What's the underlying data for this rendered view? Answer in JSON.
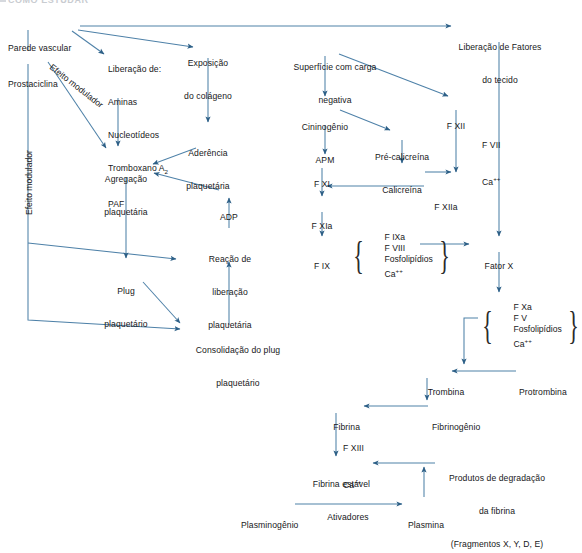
{
  "page": {
    "header_partial": "COMO ESTUDAR",
    "line_color": "#4e81a8",
    "text_color": "#17181a",
    "background": "#ffffff",
    "width": 558,
    "height": 530
  },
  "nodes": {
    "parede_vascular": "Parede vascular",
    "prostaciclina": "Prostaciclina",
    "liberacao_de_title": "Liberação de:",
    "liberacao_de_1": "Aminas",
    "liberacao_de_2": "Nucleotídeos",
    "liberacao_de_3": "Tromboxano A",
    "liberacao_de_3_sub": "2",
    "liberacao_de_4": "PAF",
    "exposicao_colageno_1": "Exposição",
    "exposicao_colageno_2": "do colágeno",
    "aderencia_plaquetaria_1": "Aderência",
    "aderencia_plaquetaria_2": "plaquetária",
    "agregacao_plaquetaria_1": "Agregação",
    "agregacao_plaquetaria_2": "plaquetária",
    "adp": "ADP",
    "reacao_liberacao_1": "Reação de",
    "reacao_liberacao_2": "liberação",
    "reacao_liberacao_3": "plaquetária",
    "plug_plaquetario_1": "Plug",
    "plug_plaquetario_2": "plaquetário",
    "consolidacao_1": "Consolidação do plug",
    "consolidacao_2": "plaquetário",
    "efeito_modulador_vertical": "Efeito modulador",
    "efeito_modulador_diagonal": "Efeito modulador",
    "superficie_carga_1": "Superfície com carga",
    "superficie_carga_2": "negativa",
    "cininogenio_1": "Cininogênio",
    "cininogenio_2": "APM",
    "pre_calicreina": "Pré-calicreína",
    "calicreina": "Calicreína",
    "f_xii": "F XII",
    "f_xiia": "F XIIa",
    "f_xi": "F XI",
    "f_xia": "F XIa",
    "f_ix": "F IX",
    "liberacao_fatores_1": "Liberação de Fatores",
    "liberacao_fatores_2": "do tecido",
    "f_vii_ca_1": "F VII",
    "f_vii_ca_2": "Ca",
    "f_vii_ca_2_sup": "++",
    "fator_x": "Fator X",
    "trombina": "Trombina",
    "protrombina": "Protrombina",
    "fibrina": "Fibrina",
    "fibrinogenio": "Fibrinogênio",
    "f_xiii_ca_1": "F XIII",
    "f_xiii_ca_2": "Ca",
    "f_xiii_ca_2_sup": "++",
    "fibrina_estavel": "Fibrina estável",
    "produtos_degradacao_1": "Produtos de degradação",
    "produtos_degradacao_2": "da fibrina",
    "produtos_degradacao_3": "(Fragmentos X, Y, D, E)",
    "plasminogenio": "Plasminogênio",
    "ativadores": "Ativadores",
    "plasmina": "Plasmina"
  },
  "brace_groups": {
    "tenase": {
      "items": [
        "F IXa",
        "F VIII",
        "Fosfolipídios",
        "Ca++"
      ],
      "item_1": "F IXa",
      "item_2": "F VIII",
      "item_3": "Fosfolipídios",
      "item_4": "Ca",
      "item_4_sup": "++"
    },
    "prothrombinase": {
      "items": [
        "F Xa",
        "F V",
        "Fosfolipídios",
        "Ca++"
      ],
      "item_1": "F Xa",
      "item_2": "F V",
      "item_3": "Fosfolipídios",
      "item_4": "Ca",
      "item_4_sup": "++"
    }
  }
}
